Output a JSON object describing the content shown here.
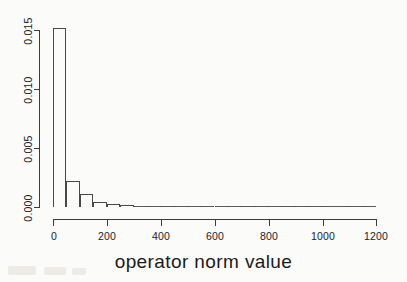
{
  "chart_data": {
    "type": "bar",
    "title": "",
    "subtitle": "",
    "xlabel": "operator norm value",
    "ylabel": "",
    "xlim": [
      0,
      1250
    ],
    "ylim": [
      0.0,
      0.0155
    ],
    "grid": false,
    "legend": false,
    "legend_position": "none",
    "bin_width": 50,
    "x_tick_labels": [
      "0",
      "200",
      "400",
      "600",
      "800",
      "1000",
      "1200"
    ],
    "x_tick_values": [
      0,
      200,
      400,
      600,
      800,
      1000,
      1200
    ],
    "y_tick_labels": [
      "0.000",
      "0.005",
      "0.010",
      "0.015"
    ],
    "y_tick_values": [
      0.0,
      0.005,
      0.01,
      0.015
    ],
    "bin_edges": [
      0,
      50,
      100,
      150,
      200,
      250,
      300,
      350,
      400,
      450,
      500,
      550,
      600,
      650,
      700,
      750,
      800,
      850,
      900,
      950,
      1000,
      1050,
      1100,
      1150,
      1200
    ],
    "categories": [
      "0-50",
      "50-100",
      "100-150",
      "150-200",
      "200-250",
      "250-300",
      "300-350",
      "350-400",
      "400-450",
      "450-500",
      "500-550",
      "550-600",
      "600-650",
      "650-700",
      "700-750",
      "750-800",
      "800-850",
      "850-900",
      "900-950",
      "950-1000",
      "1000-1050",
      "1050-1100",
      "1100-1150",
      "1150-1200"
    ],
    "values": [
      0.0152,
      0.00222,
      0.00108,
      0.00042,
      0.00026,
      0.00021,
      0.00018,
      0.00014,
      0.0001,
      7e-05,
      3e-05,
      2e-05,
      2e-05,
      1e-05,
      1e-05,
      1e-05,
      1e-05,
      1e-05,
      1e-05,
      1e-05,
      1e-05,
      1e-05,
      1e-05,
      1e-05
    ]
  },
  "axes": {
    "x_label": "operator norm value"
  },
  "colors": {
    "axis": "#3d3c3b",
    "bar_outline": "#4a4846",
    "text": "#1b1a19",
    "background": "#fbfbfa"
  }
}
